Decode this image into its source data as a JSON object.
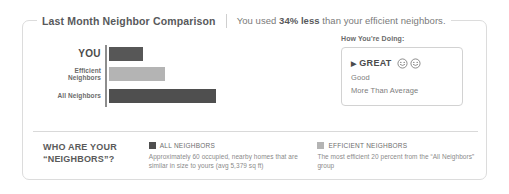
{
  "header": {
    "title": "Last Month Neighbor Comparison",
    "summary_prefix": "You used ",
    "summary_emphasis": "34% less",
    "summary_suffix": " than your efficient neighbors."
  },
  "chart_data": {
    "type": "bar",
    "orientation": "horizontal",
    "title": "Last Month Neighbor Comparison",
    "xlabel": "",
    "ylabel": "",
    "categories": [
      "YOU",
      "Efficient Neighbors",
      "All Neighbors"
    ],
    "values": [
      34,
      56,
      107
    ],
    "xlim": [
      0,
      107
    ],
    "grid": false,
    "legend_position": "bottom",
    "bar_colors": [
      "#575757",
      "#b4b4b4",
      "#4f4f4f"
    ],
    "bars": [
      {
        "label": "YOU",
        "value": 34,
        "width_px": 34,
        "color": "#575757"
      },
      {
        "label": "Efficient Neighbors",
        "value": 56,
        "width_px": 56,
        "color": "#b4b4b4"
      },
      {
        "label": "All Neighbors",
        "value": 107,
        "width_px": 107,
        "color": "#4f4f4f"
      }
    ]
  },
  "how_youre_doing": {
    "title": "How You're Doing:",
    "items": [
      {
        "label": "GREAT",
        "active": true,
        "caret": "▶",
        "smileys": 2
      },
      {
        "label": "Good",
        "active": false
      },
      {
        "label": "More Than Average",
        "active": false
      }
    ]
  },
  "footer": {
    "title_line1": "WHO ARE YOUR",
    "title_line2": "“NEIGHBORS”?",
    "legend": [
      {
        "name": "ALL NEIGHBORS",
        "color": "#4f4f4f",
        "description": "Approximately 60 occupied, nearby homes that are similar in size to yours (avg 5,379 sq ft)"
      },
      {
        "name": "EFFICIENT NEIGHBORS",
        "color": "#b4b4b4",
        "description": "The most efficient 20 percent from the “All Neighbors” group"
      }
    ]
  }
}
